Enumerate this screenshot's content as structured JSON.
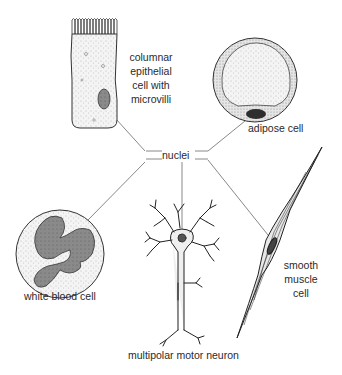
{
  "diagram": {
    "center_label": "nuclei",
    "cells": [
      {
        "id": "epithelial",
        "label_lines": [
          "columnar",
          "epithelial",
          "cell with",
          "microvilli"
        ]
      },
      {
        "id": "adipose",
        "label_lines": [
          "adipose cell"
        ]
      },
      {
        "id": "wbc",
        "label_lines": [
          "white blood cell"
        ]
      },
      {
        "id": "neuron",
        "label_lines": [
          "multipolar motor neuron"
        ]
      },
      {
        "id": "smooth_muscle",
        "label_lines": [
          "smooth",
          "muscle",
          "cell"
        ]
      }
    ],
    "colors": {
      "outline": "#333333",
      "stipple": "#bdbdbd",
      "nucleus_fill": "#7a7a7a",
      "adipose_nucleus": "#2e2e2e",
      "leader_line": "#555555"
    }
  }
}
